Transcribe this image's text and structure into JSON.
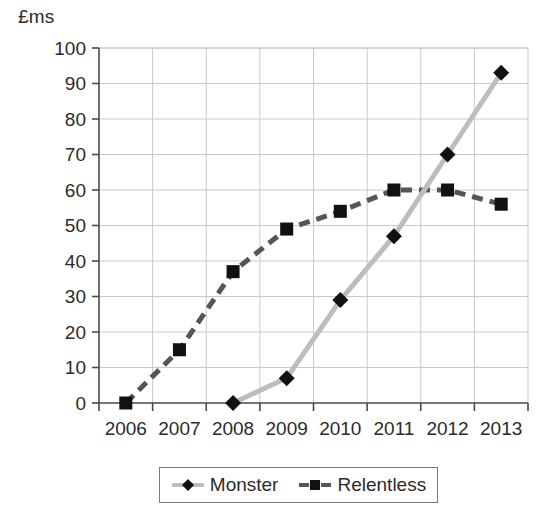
{
  "chart_data": {
    "type": "line",
    "title": "",
    "subtitle": "",
    "xlabel": "",
    "ylabel": "£ms",
    "ylim": [
      0,
      100
    ],
    "ytick_step": 10,
    "yticks": [
      "100",
      "90",
      "80",
      "70",
      "60",
      "50",
      "40",
      "30",
      "20",
      "10",
      "0"
    ],
    "categories": [
      "2006",
      "2007",
      "2008",
      "2009",
      "2010",
      "2011",
      "2012",
      "2013"
    ],
    "grid": true,
    "legend_position": "bottom",
    "series": [
      {
        "name": "Monster",
        "marker": "diamond",
        "line_style": "solid",
        "line_color": "#bdbdbd",
        "marker_color": "#111111",
        "values": [
          null,
          null,
          0,
          7,
          29,
          47,
          70,
          93
        ]
      },
      {
        "name": "Relentless",
        "marker": "square",
        "line_style": "dashed",
        "line_color": "#555555",
        "marker_color": "#111111",
        "values": [
          0,
          15,
          37,
          49,
          54,
          60,
          60,
          56
        ]
      }
    ]
  },
  "legend": {
    "items": [
      {
        "label": "Monster",
        "swatch": "diamond-marker-icon"
      },
      {
        "label": "Relentless",
        "swatch": "square-marker-icon"
      }
    ]
  },
  "axes": {
    "unit_label": "£ms",
    "x_labels": [
      "2006",
      "2007",
      "2008",
      "2009",
      "2010",
      "2011",
      "2012",
      "2013"
    ],
    "y_labels": [
      "100",
      "90",
      "80",
      "70",
      "60",
      "50",
      "40",
      "30",
      "20",
      "10",
      "0"
    ]
  },
  "colors": {
    "monster_line": "#bdbdbd",
    "relentless_line": "#555555",
    "marker": "#111111",
    "grid": "#c9c9c9",
    "axis": "#4a4a4a",
    "text": "#2b2b2b"
  }
}
